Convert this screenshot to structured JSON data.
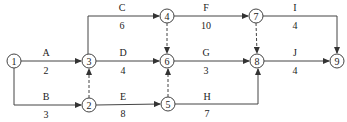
{
  "diagram": {
    "type": "activity-on-arrow network",
    "nodes": [
      {
        "id": "1",
        "x": 14,
        "y": 61
      },
      {
        "id": "2",
        "x": 89,
        "y": 105
      },
      {
        "id": "3",
        "x": 89,
        "y": 61
      },
      {
        "id": "4",
        "x": 167,
        "y": 16
      },
      {
        "id": "5",
        "x": 168,
        "y": 104
      },
      {
        "id": "6",
        "x": 167,
        "y": 61
      },
      {
        "id": "7",
        "x": 256,
        "y": 16
      },
      {
        "id": "8",
        "x": 257,
        "y": 61
      },
      {
        "id": "9",
        "x": 337,
        "y": 61
      }
    ],
    "activities": [
      {
        "name": "A",
        "duration": "2",
        "from": "1",
        "to": "3"
      },
      {
        "name": "B",
        "duration": "3",
        "from": "1",
        "to": "2"
      },
      {
        "name": "C",
        "duration": "6",
        "from": "3",
        "to": "4"
      },
      {
        "name": "D",
        "duration": "4",
        "from": "3",
        "to": "6"
      },
      {
        "name": "E",
        "duration": "8",
        "from": "2",
        "to": "5"
      },
      {
        "name": "F",
        "duration": "10",
        "from": "4",
        "to": "7"
      },
      {
        "name": "G",
        "duration": "3",
        "from": "6",
        "to": "8"
      },
      {
        "name": "H",
        "duration": "7",
        "from": "5",
        "to": "8"
      },
      {
        "name": "I",
        "duration": "4",
        "from": "7",
        "to": "9"
      },
      {
        "name": "J",
        "duration": "4",
        "from": "8",
        "to": "9"
      }
    ],
    "dummies": [
      {
        "from": "2",
        "to": "3"
      },
      {
        "from": "4",
        "to": "6"
      },
      {
        "from": "5",
        "to": "6"
      },
      {
        "from": "7",
        "to": "8"
      }
    ],
    "colors": {
      "line": "#333333",
      "text": "#222222"
    }
  }
}
